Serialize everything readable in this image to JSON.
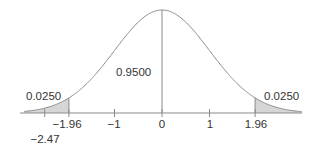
{
  "chart_data": {
    "type": "area",
    "title": "",
    "xlabel": "",
    "ylabel": "",
    "distribution": {
      "name": "standard normal",
      "mean": 0,
      "sd": 1
    },
    "xlim": [
      -2.9,
      2.95
    ],
    "x_ticks": [
      {
        "value": -1.96,
        "label": "−1.96"
      },
      {
        "value": -1,
        "label": "−1"
      },
      {
        "value": 0,
        "label": "0"
      },
      {
        "value": 1,
        "label": "1"
      },
      {
        "value": 1.96,
        "label": "1.96"
      }
    ],
    "extra_marks": [
      {
        "value": -2.47,
        "label": "−2.47"
      }
    ],
    "shaded_regions": [
      {
        "from": -2.9,
        "to": -1.96,
        "area": 0.025,
        "label": "0.0250"
      },
      {
        "from": 1.96,
        "to": 2.95,
        "area": 0.025,
        "label": "0.0250"
      }
    ],
    "center_region": {
      "from": -1.96,
      "to": 1.96,
      "area": 0.95,
      "label": "0.9500"
    },
    "vertical_lines": [
      -1.96,
      0,
      1.96
    ],
    "grid": false,
    "legend": null,
    "colors": {
      "curve": "#8a8a8a",
      "shade": "#d6d6d6",
      "axis": "#8a8a8a",
      "text": "#333333"
    }
  },
  "labels": {
    "left_tail": "0.0250",
    "right_tail": "0.0250",
    "center": "0.9500",
    "tick_neg196": "−1.96",
    "tick_neg1": "−1",
    "tick_0": "0",
    "tick_1": "1",
    "tick_196": "1.96",
    "mark_neg247": "−2.47"
  }
}
